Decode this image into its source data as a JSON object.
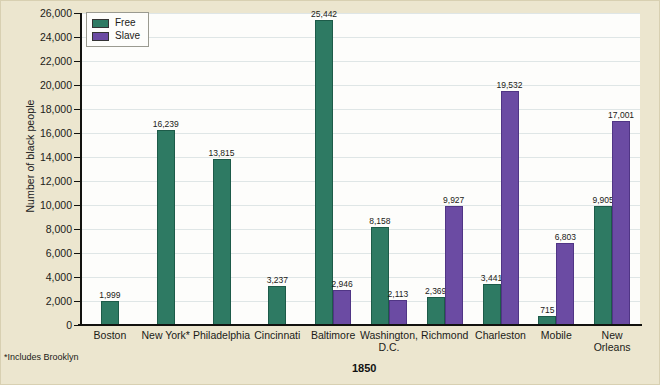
{
  "chart_data": {
    "type": "bar",
    "title": "",
    "xlabel": "1850",
    "ylabel": "Number of black people",
    "ylim": [
      0,
      26000
    ],
    "ytick_step": 2000,
    "yticks": [
      "0",
      "2,000",
      "4,000",
      "6,000",
      "8,000",
      "10,000",
      "12,000",
      "14,000",
      "16,000",
      "18,000",
      "20,000",
      "22,000",
      "24,000",
      "26,000"
    ],
    "grid": true,
    "legend_position": "top-left",
    "categories": [
      "Boston",
      "New York*",
      "Philadelphia",
      "Cincinnati",
      "Baltimore",
      "Washington, D.C.",
      "Richmond",
      "Charleston",
      "Mobile",
      "New Orleans"
    ],
    "series": [
      {
        "name": "Free",
        "color": "#2e7a63",
        "values": [
          1999,
          16239,
          13815,
          3237,
          25442,
          8158,
          2369,
          3441,
          715,
          9905
        ],
        "labels": [
          "1,999",
          "16,239",
          "13,815",
          "3,237",
          "25,442",
          "8,158",
          "2,369",
          "3,441",
          "715",
          "9,905"
        ]
      },
      {
        "name": "Slave",
        "color": "#6b4ba3",
        "values": [
          null,
          null,
          null,
          null,
          2946,
          2113,
          9927,
          19532,
          6803,
          17001
        ],
        "labels": [
          "",
          "",
          "",
          "",
          "2,946",
          "2,113",
          "9,927",
          "19,532",
          "6,803",
          "17,001"
        ]
      }
    ],
    "annotations": [
      "*Includes Brooklyn"
    ]
  },
  "legend": {
    "free_label": "Free",
    "slave_label": "Slave"
  },
  "axis": {
    "y_title": "Number of black people",
    "x_title": "1850"
  },
  "footnote": "*Includes Brooklyn",
  "xcats": [
    {
      "line1": "Boston",
      "line2": ""
    },
    {
      "line1": "New York*",
      "line2": ""
    },
    {
      "line1": "Philadelphia",
      "line2": ""
    },
    {
      "line1": "Cincinnati",
      "line2": ""
    },
    {
      "line1": "Baltimore",
      "line2": ""
    },
    {
      "line1": "Washington,",
      "line2": "D.C."
    },
    {
      "line1": "Richmond",
      "line2": ""
    },
    {
      "line1": "Charleston",
      "line2": ""
    },
    {
      "line1": "Mobile",
      "line2": ""
    },
    {
      "line1": "New",
      "line2": "Orleans"
    }
  ]
}
